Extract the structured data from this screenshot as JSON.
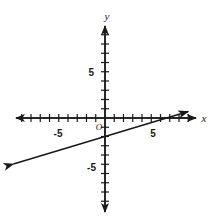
{
  "chart_data": {
    "type": "line",
    "title": "",
    "xlabel": "x",
    "ylabel": "y",
    "grid": false,
    "legend": null,
    "xlim": [
      -10.5,
      9.5
    ],
    "ylim": [
      -10.5,
      10.5
    ],
    "x_tick_labels": [
      "-5",
      "5"
    ],
    "y_tick_labels": [
      "5",
      "-5"
    ],
    "x_tick_values": [
      -5,
      5
    ],
    "y_tick_values": [
      5,
      -5
    ],
    "tick_step": 1,
    "origin_label": "O",
    "series": [
      {
        "name": "line",
        "slope": 0.3,
        "intercept": -2,
        "x": [
          -9.9,
          9.0
        ],
        "y": [
          -4.97,
          0.7
        ],
        "x_intercept": 6.67,
        "y_intercept": -2,
        "arrow_start": true,
        "arrow_end": true
      }
    ],
    "axis_arrows": {
      "x_left": true,
      "x_right": true,
      "y_top": true,
      "y_bottom": true
    },
    "colors": {
      "axis": "#1a1a1a",
      "line": "#1a1a1a",
      "background": "#ffffff"
    }
  },
  "figure": {
    "name": "coordinate-plane-line-graph",
    "x_axis_name": "x-axis",
    "y_axis_name": "y-axis"
  }
}
